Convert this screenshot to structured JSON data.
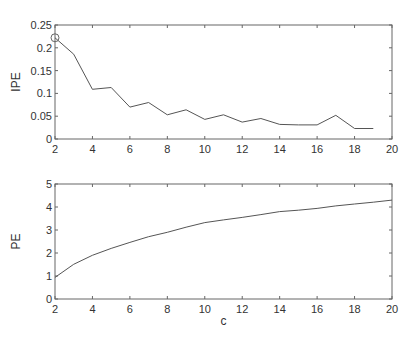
{
  "chart_data": [
    {
      "type": "line",
      "title": "",
      "xlabel": "",
      "ylabel": "IPE",
      "xlim": [
        2,
        20
      ],
      "ylim": [
        0,
        0.25
      ],
      "xticks": [
        2,
        4,
        6,
        8,
        10,
        12,
        14,
        16,
        18,
        20
      ],
      "yticks": [
        0,
        0.05,
        0.1,
        0.15,
        0.2,
        0.25
      ],
      "ytick_labels": [
        "0",
        "0.05",
        "0.1",
        "0.15",
        "0.2",
        "0.25"
      ],
      "grid": false,
      "x": [
        2,
        3,
        4,
        5,
        6,
        7,
        8,
        9,
        10,
        11,
        12,
        13,
        14,
        15,
        16,
        17,
        18,
        19
      ],
      "series": [
        {
          "name": "IPE",
          "values": [
            0.222,
            0.186,
            0.109,
            0.113,
            0.07,
            0.08,
            0.053,
            0.064,
            0.043,
            0.053,
            0.037,
            0.045,
            0.032,
            0.031,
            0.031,
            0.052,
            0.023,
            0.023
          ],
          "color": "#555555"
        }
      ],
      "annotations": [
        {
          "type": "circle-marker",
          "x": 2,
          "y": 0.222,
          "note": "minimum/optimal marker at c=2"
        }
      ]
    },
    {
      "type": "line",
      "title": "",
      "xlabel": "c",
      "ylabel": "PE",
      "xlim": [
        2,
        20
      ],
      "ylim": [
        0,
        5
      ],
      "xticks": [
        2,
        4,
        6,
        8,
        10,
        12,
        14,
        16,
        18,
        20
      ],
      "yticks": [
        0,
        1,
        2,
        3,
        4,
        5
      ],
      "ytick_labels": [
        "0",
        "1",
        "2",
        "3",
        "4",
        "5"
      ],
      "grid": false,
      "x": [
        2,
        3,
        4,
        5,
        6,
        7,
        8,
        9,
        10,
        11,
        12,
        13,
        14,
        15,
        16,
        17,
        18,
        19,
        20
      ],
      "series": [
        {
          "name": "PE",
          "values": [
            0.94,
            1.51,
            1.9,
            2.2,
            2.46,
            2.71,
            2.9,
            3.12,
            3.32,
            3.44,
            3.55,
            3.67,
            3.8,
            3.86,
            3.94,
            4.05,
            4.13,
            4.21,
            4.3
          ],
          "color": "#555555"
        }
      ]
    }
  ],
  "layout": {
    "panels": [
      {
        "left": 55,
        "top": 25,
        "right": 392,
        "bottom": 139
      },
      {
        "left": 55,
        "top": 184,
        "right": 392,
        "bottom": 299
      }
    ]
  }
}
